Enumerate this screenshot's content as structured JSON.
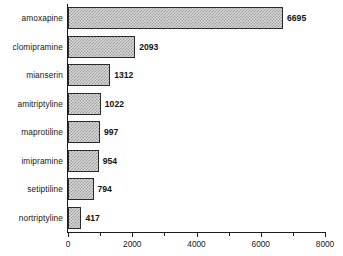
{
  "chart_data": {
    "type": "bar",
    "orientation": "horizontal",
    "title": "",
    "subtitle": "",
    "xlabel": "",
    "ylabel": "",
    "categories": [
      "amoxapine",
      "clomipramine",
      "mianserin",
      "amitriptyline",
      "maprotiline",
      "imipramine",
      "setiptiline",
      "nortriptyline"
    ],
    "values": [
      6695,
      2093,
      1312,
      1022,
      997,
      954,
      794,
      417
    ],
    "value_labels": [
      "6695",
      "2093",
      "1312",
      "1022",
      "997",
      "954",
      "794",
      "417"
    ],
    "xlim": [
      0,
      8000
    ],
    "xticks": [
      0,
      2000,
      4000,
      6000,
      8000
    ],
    "xtick_labels": [
      "0",
      "2000",
      "4000",
      "6000",
      "8000"
    ],
    "x_minor_ticks": [
      1000,
      3000,
      5000,
      7000
    ],
    "grid": false,
    "legend": null,
    "bar_fill_color": "#d9d9d9",
    "bar_pattern": "stipple-checker",
    "bar_edge_color": "#2a2a2a",
    "axis_color": "#1d1d1d",
    "background_color": "#ffffff"
  }
}
